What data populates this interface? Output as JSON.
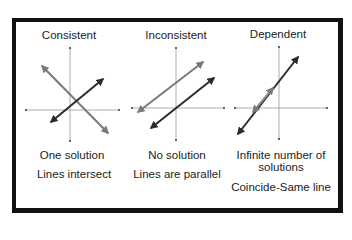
{
  "panels": [
    {
      "title": "Consistent",
      "captions": [
        "One solution",
        "Lines intersect"
      ],
      "lines": [
        {
          "color": "#7a7a7a",
          "x1": 42,
          "y1": 66,
          "x2": 108,
          "y2": 133
        },
        {
          "color": "#2b2b2b",
          "x1": 51,
          "y1": 122,
          "x2": 103,
          "y2": 79
        }
      ]
    },
    {
      "title": "Inconsistent",
      "captions": [
        "No solution",
        "Lines are parallel"
      ],
      "lines": [
        {
          "color": "#7a7a7a",
          "x1": 138,
          "y1": 112,
          "x2": 203,
          "y2": 62
        },
        {
          "color": "#2b2b2b",
          "x1": 151,
          "y1": 128,
          "x2": 214,
          "y2": 78
        }
      ]
    },
    {
      "title": "Dependent",
      "captions": [
        "Infinite number of",
        "solutions",
        "Coincide-Same line"
      ],
      "lines": [
        {
          "color": "#2b2b2b",
          "x1": 238,
          "y1": 134,
          "x2": 298,
          "y2": 57
        },
        {
          "color": "#8a8a8a",
          "x1": 253,
          "y1": 112,
          "x2": 273,
          "y2": 88
        }
      ]
    }
  ],
  "colors": {
    "frame": "#111111",
    "axis": "#9a9a9a",
    "line_gray": "#7a7a7a",
    "line_dark": "#2b2b2b"
  }
}
